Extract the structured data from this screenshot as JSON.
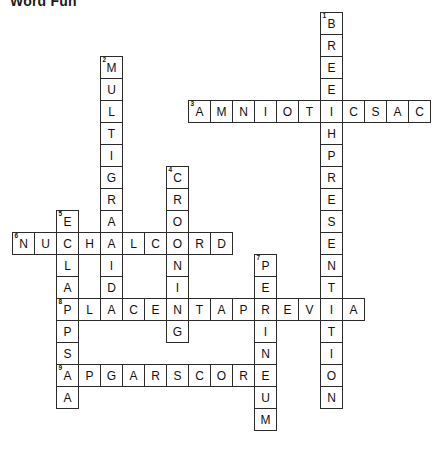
{
  "puzzle": {
    "title": "Word Fun",
    "grid": {
      "cell_size": 23,
      "origin_x": 12,
      "origin_y": 12,
      "columns": 19,
      "rows": 19,
      "cell_background": "#ffffff",
      "cell_border_color": "#2b2b2b",
      "letter_color": "#111111",
      "number_color": "#111111"
    },
    "entries": [
      {
        "number": 1,
        "direction": "down",
        "answer": "BREECHPRESENTATION",
        "length": 18,
        "start_col": 14,
        "start_row": 0
      },
      {
        "number": 2,
        "direction": "down",
        "answer": "MULTIGRAVIDA",
        "length": 12,
        "start_col": 4,
        "start_row": 2
      },
      {
        "number": 3,
        "direction": "across",
        "answer": "AMNIOTICSAC",
        "length": 11,
        "start_col": 8,
        "start_row": 4
      },
      {
        "number": 4,
        "direction": "down",
        "answer": "CROWNING",
        "length": 8,
        "start_col": 7,
        "start_row": 7
      },
      {
        "number": 5,
        "direction": "down",
        "answer": "ECLAMPSIA",
        "length": 9,
        "start_col": 2,
        "start_row": 9
      },
      {
        "number": 6,
        "direction": "across",
        "answer": "NUCHALCORD",
        "length": 10,
        "start_col": 0,
        "start_row": 10
      },
      {
        "number": 7,
        "direction": "down",
        "answer": "PERINEUM",
        "length": 8,
        "start_col": 11,
        "start_row": 11
      },
      {
        "number": 8,
        "direction": "across",
        "answer": "PLACENTAPREVIA",
        "length": 14,
        "start_col": 2,
        "start_row": 13
      },
      {
        "number": 9,
        "direction": "across",
        "answer": "APGARSCORE",
        "length": 10,
        "start_col": 2,
        "start_row": 16
      }
    ]
  }
}
